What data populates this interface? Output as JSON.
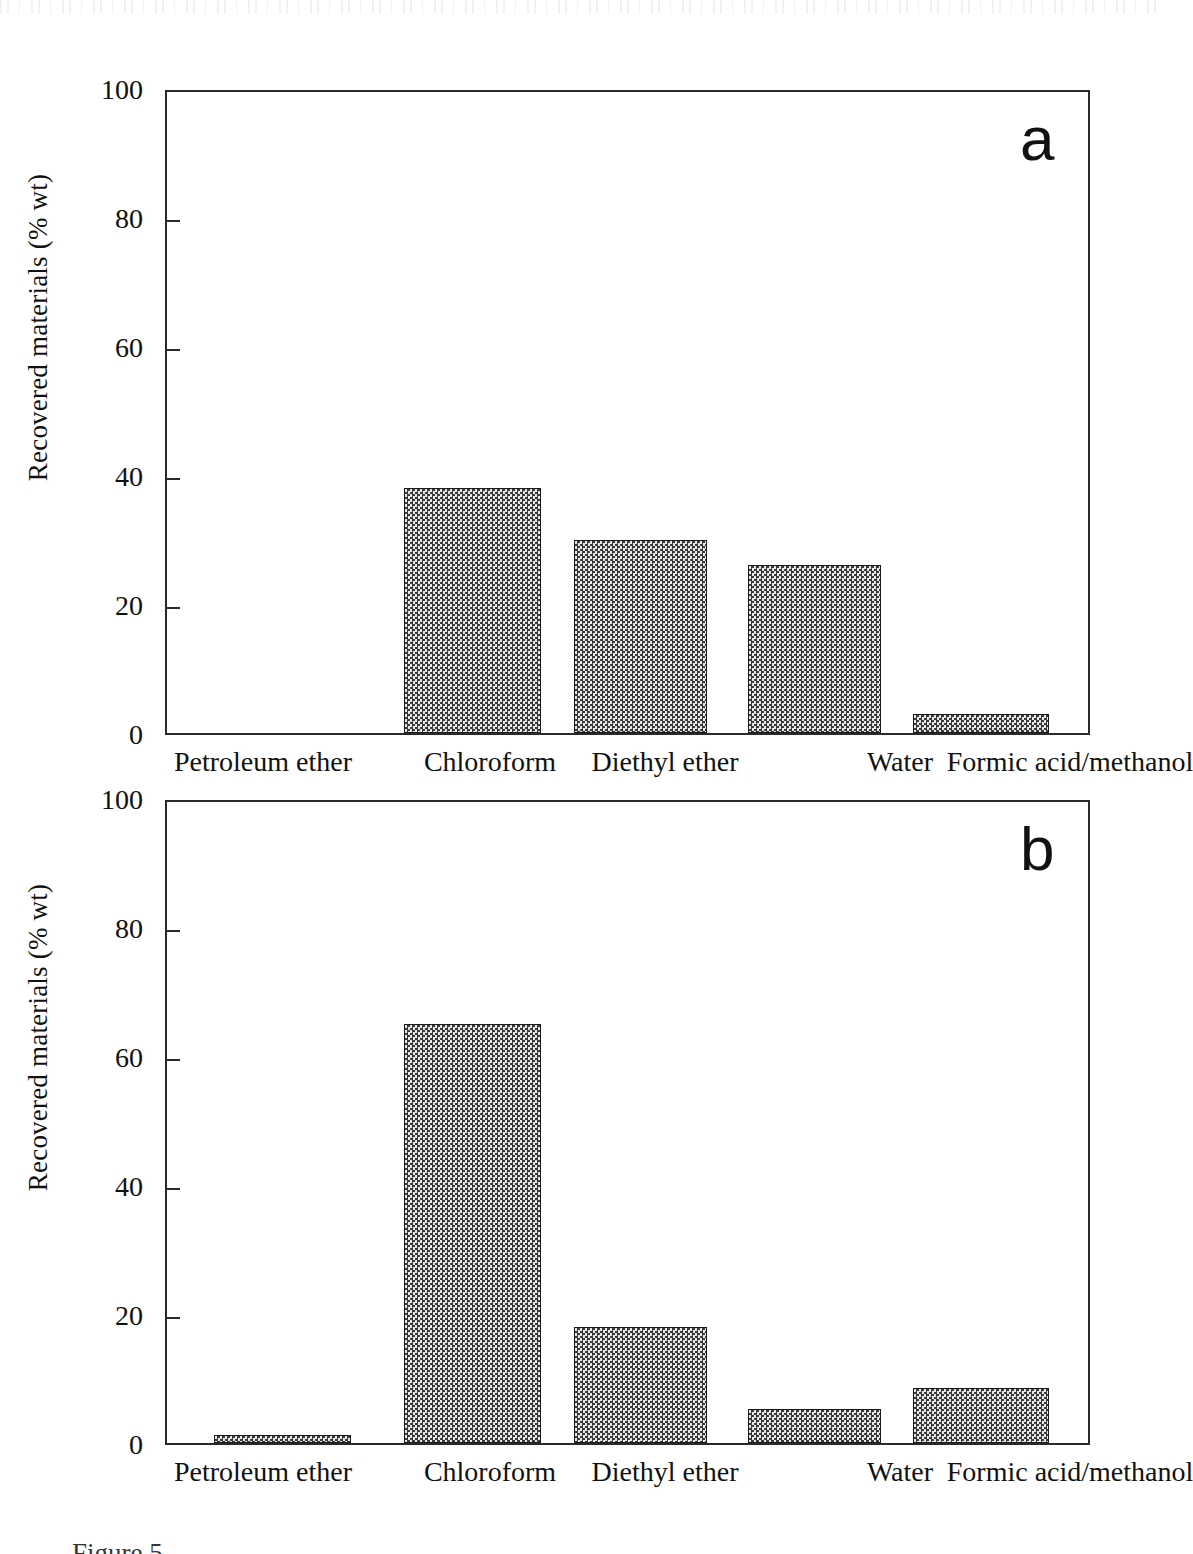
{
  "figure": {
    "caption_partial": "Figure 5",
    "panels": [
      "a",
      "b"
    ]
  },
  "panel_a": {
    "letter": "a"
  },
  "panel_b": {
    "letter": "b"
  },
  "chart_data": [
    {
      "type": "bar",
      "title": "a",
      "panel": "a",
      "categories": [
        "Petroleum ether",
        "Chloroform",
        "Diethyl ether",
        "Water",
        "Formic acid/methanol"
      ],
      "values": [
        0,
        38,
        30,
        26,
        3
      ],
      "xlabel": "",
      "ylabel": "Recovered materials (% wt)",
      "ylim": [
        0,
        100
      ],
      "yticks": [
        0,
        20,
        40,
        60,
        80,
        100
      ],
      "yticklabels": [
        "0",
        "20",
        "40",
        "60",
        "80",
        "100"
      ],
      "grid": false,
      "legend": "none",
      "bar_fill": "#9d9d9d",
      "bar_edge": "#1a1a1a",
      "axis_color": "#2a2a2a"
    },
    {
      "type": "bar",
      "title": "b",
      "panel": "b",
      "categories": [
        "Petroleum ether",
        "Chloroform",
        "Diethyl ether",
        "Water",
        "Formic acid/methanol"
      ],
      "values": [
        1.3,
        65,
        18,
        5.2,
        8.5
      ],
      "xlabel": "",
      "ylabel": "Recovered materials (% wt)",
      "ylim": [
        0,
        100
      ],
      "yticks": [
        0,
        20,
        40,
        60,
        80,
        100
      ],
      "yticklabels": [
        "0",
        "20",
        "40",
        "60",
        "80",
        "100"
      ],
      "grid": false,
      "legend": "none",
      "bar_fill": "#9d9d9d",
      "bar_edge": "#1a1a1a",
      "axis_color": "#2a2a2a"
    }
  ]
}
